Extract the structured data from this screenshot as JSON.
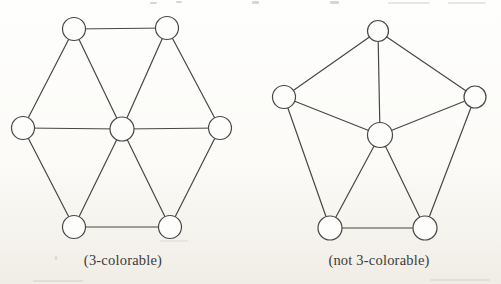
{
  "page": {
    "palette": {
      "line_color": "#474747",
      "node_fill": "#fdfdfb",
      "label_color": "#3b3b3b",
      "paper_top": "#fefefd",
      "paper_bottom": "#efede6"
    }
  },
  "figure": {
    "graphs": [
      {
        "id": "hexagonal-wheel",
        "label": "(3-colorable)",
        "nodes": [
          {
            "id": "top-left",
            "x": 74,
            "y": 29,
            "r": 11.5
          },
          {
            "id": "top-right",
            "x": 167,
            "y": 28,
            "r": 11.5
          },
          {
            "id": "right",
            "x": 220,
            "y": 128,
            "r": 11.5
          },
          {
            "id": "bottom-right",
            "x": 170,
            "y": 227,
            "r": 11.5
          },
          {
            "id": "bottom-left",
            "x": 74,
            "y": 227,
            "r": 11.5
          },
          {
            "id": "left",
            "x": 23,
            "y": 128,
            "r": 11.5
          },
          {
            "id": "center",
            "x": 122,
            "y": 129,
            "r": 12
          }
        ],
        "edges": [
          [
            "left",
            "top-left"
          ],
          [
            "top-left",
            "top-right"
          ],
          [
            "top-right",
            "right"
          ],
          [
            "right",
            "bottom-right"
          ],
          [
            "bottom-right",
            "bottom-left"
          ],
          [
            "bottom-left",
            "left"
          ],
          [
            "center",
            "left"
          ],
          [
            "center",
            "top-left"
          ],
          [
            "center",
            "top-right"
          ],
          [
            "center",
            "right"
          ],
          [
            "center",
            "bottom-right"
          ],
          [
            "center",
            "bottom-left"
          ]
        ]
      },
      {
        "id": "pentagonal-wheel",
        "label": "(not 3-colorable)",
        "nodes": [
          {
            "id": "top",
            "x": 378,
            "y": 31,
            "r": 10.5
          },
          {
            "id": "upper-left",
            "x": 284,
            "y": 97,
            "r": 11.5
          },
          {
            "id": "upper-right",
            "x": 475,
            "y": 97,
            "r": 11
          },
          {
            "id": "bottom-left",
            "x": 330,
            "y": 228,
            "r": 12
          },
          {
            "id": "bottom-right",
            "x": 425,
            "y": 228,
            "r": 12
          },
          {
            "id": "center",
            "x": 380,
            "y": 135,
            "r": 12.5
          }
        ],
        "edges": [
          [
            "upper-left",
            "top"
          ],
          [
            "top",
            "upper-right"
          ],
          [
            "upper-left",
            "bottom-left"
          ],
          [
            "upper-right",
            "bottom-right"
          ],
          [
            "bottom-left",
            "bottom-right"
          ],
          [
            "center",
            "top"
          ],
          [
            "center",
            "upper-left"
          ],
          [
            "center",
            "upper-right"
          ],
          [
            "center",
            "bottom-left"
          ],
          [
            "center",
            "bottom-right"
          ]
        ]
      }
    ]
  }
}
